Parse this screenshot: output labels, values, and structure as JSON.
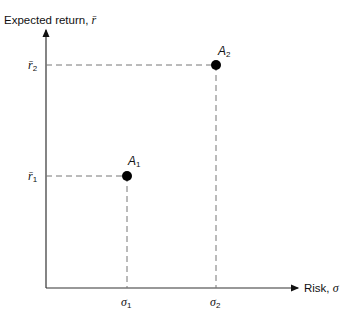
{
  "axes": {
    "y_label_text": "Expected return, ",
    "y_label_symbol": "r̄",
    "x_label_text": "Risk, ",
    "x_label_symbol": "σ"
  },
  "ticks": {
    "y": [
      {
        "symbol": "r̄",
        "sub": "2"
      },
      {
        "symbol": "r̄",
        "sub": "1"
      }
    ],
    "x": [
      {
        "symbol": "σ",
        "sub": "1"
      },
      {
        "symbol": "σ",
        "sub": "2"
      }
    ]
  },
  "points": [
    {
      "name": "A",
      "sub": "1"
    },
    {
      "name": "A",
      "sub": "2"
    }
  ],
  "colors": {
    "ink": "#111111",
    "dash": "#666666"
  }
}
